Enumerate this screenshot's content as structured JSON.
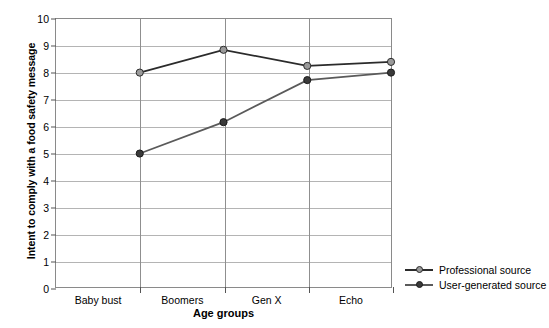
{
  "chart_data": {
    "type": "line",
    "title": "",
    "xlabel": "Age groups",
    "ylabel": "Intent to comply with a food safety message",
    "categories": [
      "Baby bust",
      "Boomers",
      "Gen X",
      "Echo"
    ],
    "ylim": [
      0,
      10
    ],
    "y_ticks": [
      0,
      1,
      2,
      3,
      4,
      5,
      6,
      7,
      8,
      9,
      10
    ],
    "y_tick_labels": [
      "0",
      "1",
      "2",
      "3",
      "4",
      "5",
      "6",
      "7",
      "8",
      "9",
      "10"
    ],
    "grid": "horizontal-and-vertical",
    "legend_position": "right-bottom-outside",
    "series": [
      {
        "name": "Professional source",
        "values": [
          8.0,
          8.85,
          8.25,
          8.4
        ],
        "line_color": "#2b2b2b",
        "marker_color": "#9a9a9a",
        "marker_edge_color": "#2b2b2b"
      },
      {
        "name": "User-generated source",
        "values": [
          4.98,
          6.15,
          7.72,
          8.0
        ],
        "line_color": "#5a5a5a",
        "marker_color": "#3a3a3a",
        "marker_edge_color": "#1a1a1a"
      }
    ]
  },
  "axes": {
    "y_title": "Intent to comply with a food safety message",
    "x_title": "Age groups"
  },
  "legend": {
    "items": [
      {
        "label": "Professional source"
      },
      {
        "label": "User-generated source"
      }
    ]
  },
  "colors": {
    "plot_border": "#8a8a8a",
    "gridline_horizontal": "#b4b4b4",
    "gridline_vertical": "#8f8f8f",
    "background": "#ffffff",
    "text": "#000000"
  }
}
